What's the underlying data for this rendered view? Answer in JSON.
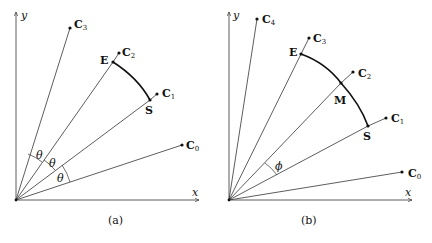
{
  "panels": [
    {
      "caption": "(a)",
      "axes": {
        "x_label": "x",
        "y_label": "y"
      },
      "points": {
        "C0": {
          "base": "C",
          "sub": "0"
        },
        "C1": {
          "base": "C",
          "sub": "1"
        },
        "C2": {
          "base": "C",
          "sub": "2"
        },
        "C3": {
          "base": "C",
          "sub": "3"
        },
        "E": {
          "label": "E"
        },
        "S": {
          "label": "S"
        }
      },
      "angle_label": "θ"
    },
    {
      "caption": "(b)",
      "axes": {
        "x_label": "x",
        "y_label": "y"
      },
      "points": {
        "C0": {
          "base": "C",
          "sub": "0"
        },
        "C1": {
          "base": "C",
          "sub": "1"
        },
        "C2": {
          "base": "C",
          "sub": "2"
        },
        "C3": {
          "base": "C",
          "sub": "3"
        },
        "C4": {
          "base": "C",
          "sub": "4"
        },
        "E": {
          "label": "E"
        },
        "M": {
          "label": "M"
        },
        "S": {
          "label": "S"
        }
      },
      "angle_label": "ϕ"
    }
  ]
}
